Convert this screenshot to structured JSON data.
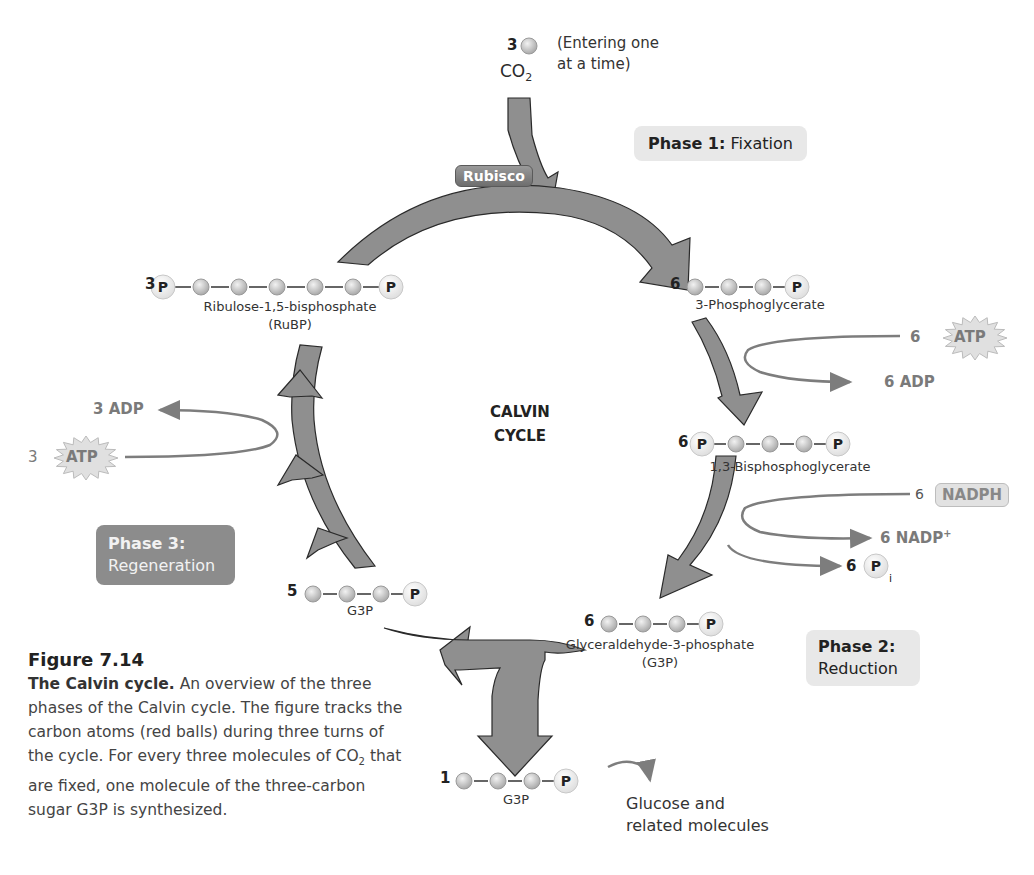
{
  "figure": {
    "number": "Figure 7.14",
    "caption_lead": "The Calvin cycle.",
    "caption_body": " An overview of the three phases of the Calvin cycle. The figure tracks the carbon atoms (red balls) during three turns of the cycle. For every three molecules of CO",
    "caption_sub": "2",
    "caption_tail": " that are fixed, one molecule of the three-carbon sugar G3P is synthesized."
  },
  "center_label": {
    "line1": "CALVIN",
    "line2": "CYCLE"
  },
  "input": {
    "count": "3",
    "molecule": "CO",
    "molecule_sub": "2",
    "note_line1": "(Entering one",
    "note_line2": "at a time)"
  },
  "enzyme": {
    "label": "Rubisco"
  },
  "phases": [
    {
      "title": "Phase 1:",
      "name": "Fixation"
    },
    {
      "title": "Phase 2:",
      "name": "Reduction"
    },
    {
      "title": "Phase 3:",
      "name": "Regeneration"
    }
  ],
  "molecules": {
    "rubp": {
      "count": "3",
      "name": "Ribulose-1,5-bisphosphate",
      "abbr": "(RuBP)",
      "structure": [
        "P",
        "C",
        "C",
        "C",
        "C",
        "C",
        "P"
      ]
    },
    "pga": {
      "count": "6",
      "name": "3-Phosphoglycerate",
      "structure": [
        "C",
        "C",
        "C",
        "P"
      ]
    },
    "bpg": {
      "count": "6",
      "name": "1,3-Bisphosphoglycerate",
      "structure": [
        "P",
        "C",
        "C",
        "C",
        "P"
      ]
    },
    "g3p": {
      "count": "6",
      "name": "Glyceraldehyde-3-phosphate",
      "abbr": "(G3P)",
      "structure": [
        "C",
        "C",
        "C",
        "P"
      ]
    },
    "g3p_recycled": {
      "count": "5",
      "name": "G3P",
      "structure": [
        "C",
        "C",
        "C",
        "P"
      ]
    },
    "g3p_output": {
      "count": "1",
      "name": "G3P",
      "structure": [
        "C",
        "C",
        "C",
        "P"
      ]
    }
  },
  "phosphate_symbol": "P",
  "energy": {
    "atp_in_reduction": {
      "count": "6",
      "label": "ATP"
    },
    "adp_out_reduction": {
      "count": "6",
      "label": "ADP"
    },
    "nadph_in": {
      "count": "6",
      "label": "NADPH"
    },
    "nadp_out": {
      "count": "6",
      "label": "NADP",
      "sup": "+"
    },
    "pi_out": {
      "count": "6",
      "label": "P",
      "sub": "i"
    },
    "atp_in_regeneration": {
      "count": "3",
      "label": "ATP"
    },
    "adp_out_regeneration": {
      "count": "3",
      "label": "ADP"
    }
  },
  "output": {
    "line1": "Glucose and",
    "line2": "related molecules"
  },
  "colors": {
    "arrow_fill": "#8f8f8f",
    "arrow_stroke": "#2a2a2a",
    "carbon_ball": "#c9c9c9",
    "phosphate_ball": "#efefef",
    "side_arrow": "#7d7d7d",
    "starburst": "#e0e0e0"
  }
}
